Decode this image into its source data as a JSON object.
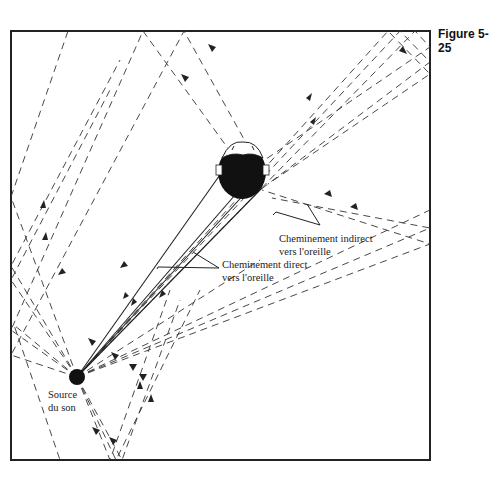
{
  "figure": {
    "label": "Figure 5-25"
  },
  "labels": {
    "source_line1": "Source",
    "source_line2": "du son",
    "direct_line1": "Cheminement direct",
    "direct_line2": "vers l'oreille",
    "indirect_line1": "Cheminement indirect",
    "indirect_line2": "vers l'oreille"
  },
  "colors": {
    "line": "#222222",
    "background": "#ffffff"
  },
  "elements": {
    "room": "room-boundary-rectangle",
    "source": "sound-source-dot",
    "listener": "head-top-view",
    "direct_paths": "solid lines from source to ears",
    "indirect_paths": "dashed reflected lines with arrowheads"
  }
}
